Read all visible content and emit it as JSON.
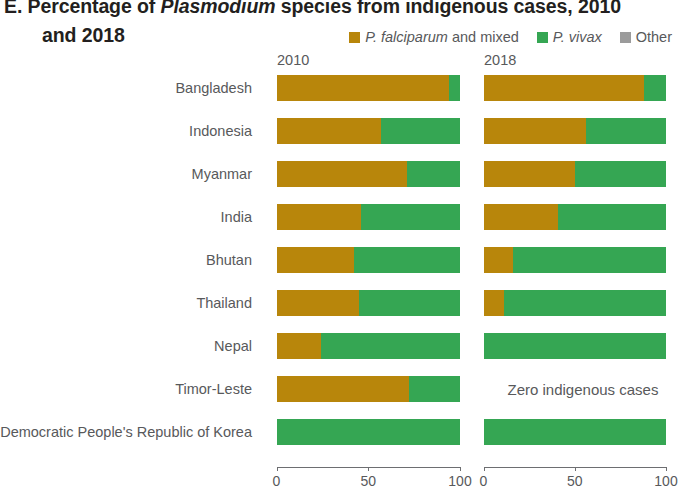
{
  "title": {
    "line1_prefix": "E. Percentage of ",
    "line1_italic": "Plasmodium",
    "line1_suffix": " species from indigenous cases, 2010",
    "line2": "and 2018"
  },
  "legend": {
    "items": [
      {
        "name": "falciparum-legend",
        "label_italic": "P. falciparum",
        "label_rest": " and mixed",
        "color": "#b8860b"
      },
      {
        "name": "vivax-legend",
        "label_italic": "P. vivax",
        "label_rest": "",
        "color": "#35a653"
      },
      {
        "name": "other-legend",
        "label_italic": "",
        "label_rest": "Other",
        "color": "#9b9b9b"
      }
    ]
  },
  "panels": {
    "left_header": "2010",
    "right_header": "2018",
    "zero_cases_text": "Zero indigenous cases"
  },
  "axis": {
    "ticks": [
      "0",
      "50",
      "100"
    ],
    "min": 0,
    "max": 100
  },
  "chart_data": {
    "type": "bar",
    "orientation": "horizontal",
    "stacked": true,
    "stacked_percent": true,
    "title": "E. Percentage of Plasmodium species from indigenous cases, 2010 and 2018",
    "xlabel": "",
    "ylabel": "",
    "xlim": [
      0,
      100
    ],
    "xticks": [
      0,
      50,
      100
    ],
    "grid": false,
    "legend_position": "top-right",
    "panels": [
      "2010",
      "2018"
    ],
    "categories": [
      "Bangladesh",
      "Indonesia",
      "Myanmar",
      "India",
      "Bhutan",
      "Thailand",
      "Nepal",
      "Timor-Leste",
      "Democratic People's Republic of Korea"
    ],
    "series": [
      {
        "name": "P. falciparum and mixed",
        "color": "#b8860b"
      },
      {
        "name": "P. vivax",
        "color": "#35a653"
      },
      {
        "name": "Other",
        "color": "#9b9b9b"
      }
    ],
    "values_2010": [
      {
        "category": "Bangladesh",
        "falciparum": 94,
        "vivax": 6,
        "other": 0
      },
      {
        "category": "Indonesia",
        "falciparum": 57,
        "vivax": 43,
        "other": 0
      },
      {
        "category": "Myanmar",
        "falciparum": 71,
        "vivax": 29,
        "other": 0
      },
      {
        "category": "India",
        "falciparum": 46,
        "vivax": 54,
        "other": 0
      },
      {
        "category": "Bhutan",
        "falciparum": 42,
        "vivax": 58,
        "other": 0
      },
      {
        "category": "Thailand",
        "falciparum": 45,
        "vivax": 55,
        "other": 0
      },
      {
        "category": "Nepal",
        "falciparum": 24,
        "vivax": 76,
        "other": 0
      },
      {
        "category": "Timor-Leste",
        "falciparum": 72,
        "vivax": 28,
        "other": 0
      },
      {
        "category": "Democratic People's Republic of Korea",
        "falciparum": 0,
        "vivax": 100,
        "other": 0
      }
    ],
    "values_2018": [
      {
        "category": "Bangladesh",
        "falciparum": 88,
        "vivax": 12,
        "other": 0
      },
      {
        "category": "Indonesia",
        "falciparum": 56,
        "vivax": 44,
        "other": 0
      },
      {
        "category": "Myanmar",
        "falciparum": 50,
        "vivax": 50,
        "other": 0
      },
      {
        "category": "India",
        "falciparum": 41,
        "vivax": 59,
        "other": 0
      },
      {
        "category": "Bhutan",
        "falciparum": 16,
        "vivax": 84,
        "other": 0
      },
      {
        "category": "Thailand",
        "falciparum": 11,
        "vivax": 89,
        "other": 0
      },
      {
        "category": "Nepal",
        "falciparum": 0,
        "vivax": 100,
        "other": 0
      },
      {
        "category": "Timor-Leste",
        "no_data": true,
        "note": "Zero indigenous cases"
      },
      {
        "category": "Democratic People's Republic of Korea",
        "falciparum": 0,
        "vivax": 100,
        "other": 0
      }
    ]
  }
}
